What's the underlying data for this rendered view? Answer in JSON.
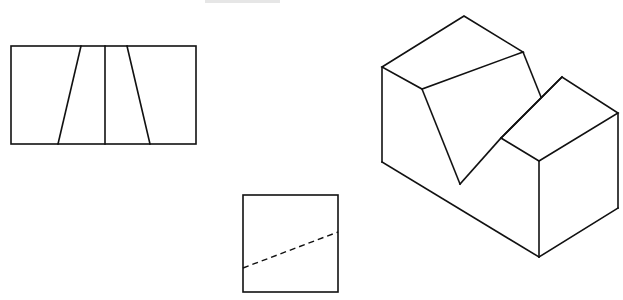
{
  "diagram": {
    "type": "orthographic-projection-exercise",
    "colors": {
      "line": "#111111",
      "background": "#ffffff"
    },
    "views": [
      {
        "name": "front-view",
        "description": "Rectangle with vertical center line and two slanted lines forming a trapezoid"
      },
      {
        "name": "side-view",
        "description": "Square with a dashed hidden line rising left to right"
      },
      {
        "name": "isometric-view",
        "description": "Block with V-shaped notch cut across the top"
      }
    ],
    "caption": ""
  }
}
